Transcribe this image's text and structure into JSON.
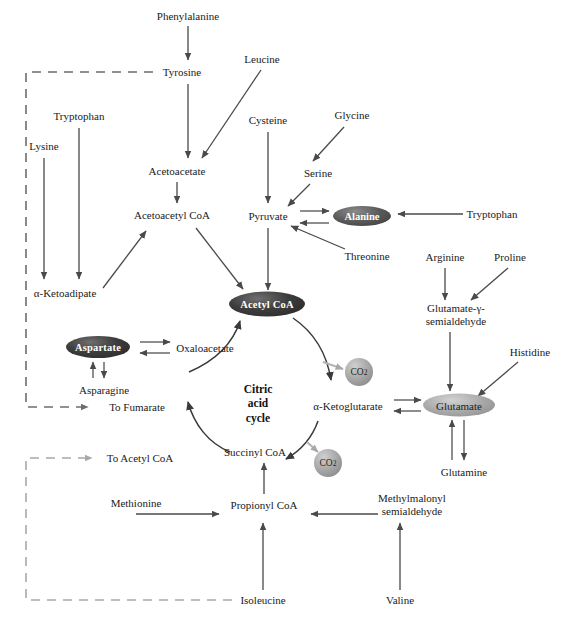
{
  "diagram": {
    "center_label_line1": "Citric",
    "center_label_line2": "acid",
    "center_label_line3": "cycle",
    "colors": {
      "arrow": "#4a4a4a",
      "dashed_dark": "#6d6d6d",
      "dashed_light": "#a8a8a8",
      "node_dark": "#2f2f2f",
      "node_light": "#a9a9a9",
      "co2": "#a6a6a6",
      "text": "#1a1a1a"
    }
  },
  "labels": [
    {
      "id": "phenylalanine",
      "text": "Phenylalanine",
      "x": 188,
      "y": 16
    },
    {
      "id": "tyrosine",
      "text": "Tyrosine",
      "x": 182,
      "y": 72
    },
    {
      "id": "leucine",
      "text": "Leucine",
      "x": 262,
      "y": 59
    },
    {
      "id": "tryptophan-left",
      "text": "Tryptophan",
      "x": 79,
      "y": 116
    },
    {
      "id": "lysine",
      "text": "Lysine",
      "x": 44,
      "y": 146
    },
    {
      "id": "cysteine",
      "text": "Cysteine",
      "x": 268,
      "y": 120
    },
    {
      "id": "glycine",
      "text": "Glycine",
      "x": 352,
      "y": 115
    },
    {
      "id": "serine",
      "text": "Serine",
      "x": 318,
      "y": 173
    },
    {
      "id": "acetoacetate",
      "text": "Acetoacetate",
      "x": 177,
      "y": 171
    },
    {
      "id": "acetoacetyl-coa",
      "text": "Acetoacetyl CoA",
      "x": 172,
      "y": 215
    },
    {
      "id": "pyruvate",
      "text": "Pyruvate",
      "x": 268,
      "y": 216
    },
    {
      "id": "tryptophan-right",
      "text": "Tryptophan",
      "x": 492,
      "y": 214
    },
    {
      "id": "threonine",
      "text": "Threonine",
      "x": 367,
      "y": 256
    },
    {
      "id": "alpha-ketoadipate",
      "text": "α-Ketoadipate",
      "x": 65,
      "y": 293
    },
    {
      "id": "arginine",
      "text": "Arginine",
      "x": 445,
      "y": 257
    },
    {
      "id": "proline",
      "text": "Proline",
      "x": 510,
      "y": 257
    },
    {
      "id": "oxaloacetate",
      "text": "Oxaloacetate",
      "x": 205,
      "y": 348
    },
    {
      "id": "asparagine",
      "text": "Asparagine",
      "x": 104,
      "y": 390
    },
    {
      "id": "to-fumarate",
      "text": "To Fumarate",
      "x": 137,
      "y": 407
    },
    {
      "id": "to-acetyl-coa",
      "text": "To Acetyl CoA",
      "x": 140,
      "y": 458
    },
    {
      "id": "alpha-ketoglutarate",
      "text": "α-Ketoglutarate",
      "x": 348,
      "y": 406
    },
    {
      "id": "histidine",
      "text": "Histidine",
      "x": 530,
      "y": 352
    },
    {
      "id": "glutamine",
      "text": "Glutamine",
      "x": 464,
      "y": 472
    },
    {
      "id": "succinyl-coa",
      "text": "Succinyl CoA",
      "x": 255,
      "y": 452
    },
    {
      "id": "methionine",
      "text": "Methionine",
      "x": 136,
      "y": 503
    },
    {
      "id": "propionyl-coa",
      "text": "Propionyl CoA",
      "x": 264,
      "y": 505
    },
    {
      "id": "isoleucine",
      "text": "Isoleucine",
      "x": 263,
      "y": 600
    },
    {
      "id": "valine",
      "text": "Valine",
      "x": 400,
      "y": 600
    }
  ],
  "multiline_labels": [
    {
      "id": "glutamate-semialdehyde",
      "line1": "Glutamate-γ-",
      "line2": "semialdehyde",
      "x": 456,
      "y": 315
    },
    {
      "id": "methylmalonyl-semialdehyde",
      "line1": "Methylmalonyl",
      "line2": "semialdehyde",
      "x": 412,
      "y": 505
    }
  ],
  "nodes": [
    {
      "id": "acetyl-coa",
      "text": "Acetyl CoA",
      "style": "ell-dark",
      "x": 267,
      "y": 304,
      "w": 76,
      "h": 25
    },
    {
      "id": "alanine",
      "text": "Alanine",
      "style": "ell-mid",
      "x": 362,
      "y": 216,
      "w": 58,
      "h": 20
    },
    {
      "id": "aspartate",
      "text": "Aspartate",
      "style": "ell-dark",
      "x": 98,
      "y": 347,
      "w": 64,
      "h": 22
    },
    {
      "id": "glutamate",
      "text": "Glutamate",
      "style": "ell-light",
      "x": 459,
      "y": 405,
      "w": 72,
      "h": 23
    }
  ],
  "co2_nodes": [
    {
      "id": "co2-upper",
      "text": "CO",
      "sub": "2",
      "x": 359,
      "y": 372,
      "d": 28
    },
    {
      "id": "co2-lower",
      "text": "CO",
      "sub": "2",
      "x": 328,
      "y": 463,
      "d": 28
    }
  ],
  "center": {
    "x": 258,
    "y": 404
  }
}
